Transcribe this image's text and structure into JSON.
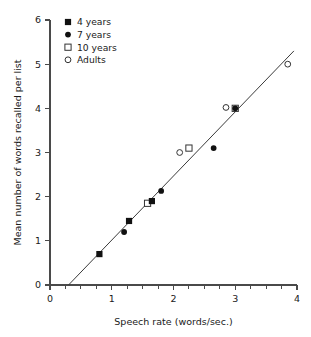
{
  "chart_data": {
    "type": "scatter",
    "title": "",
    "xlabel": "Speech rate (words/sec.)",
    "ylabel": "Mean number of words recalled per list",
    "xlim": [
      0,
      4
    ],
    "ylim": [
      0,
      6
    ],
    "xticks": [
      0,
      1,
      2,
      3,
      4
    ],
    "xtick_labels": [
      "0",
      "1",
      "2",
      "3",
      "4"
    ],
    "xminor_step": 0.25,
    "yticks": [
      0,
      1,
      2,
      3,
      4,
      5,
      6
    ],
    "ytick_labels": [
      "0",
      "1",
      "2",
      "3",
      "4",
      "5",
      "6"
    ],
    "grid": false,
    "legend_position": "top-left",
    "series": [
      {
        "name": "4 years",
        "marker": "filled-square",
        "color": "#111111",
        "points": [
          {
            "x": 0.8,
            "y": 0.7
          },
          {
            "x": 1.28,
            "y": 1.45
          },
          {
            "x": 1.65,
            "y": 1.9
          }
        ]
      },
      {
        "name": "7 years",
        "marker": "filled-circle",
        "color": "#111111",
        "points": [
          {
            "x": 1.2,
            "y": 1.2
          },
          {
            "x": 1.8,
            "y": 2.13
          },
          {
            "x": 2.65,
            "y": 3.1
          },
          {
            "x": 3.0,
            "y": 4.0
          }
        ]
      },
      {
        "name": "10 years",
        "marker": "open-square",
        "color": "#333333",
        "points": [
          {
            "x": 1.58,
            "y": 1.85
          },
          {
            "x": 2.25,
            "y": 3.1
          },
          {
            "x": 3.0,
            "y": 4.0
          }
        ]
      },
      {
        "name": "Adults",
        "marker": "open-circle",
        "color": "#333333",
        "points": [
          {
            "x": 2.1,
            "y": 3.0
          },
          {
            "x": 2.85,
            "y": 4.02
          },
          {
            "x": 3.85,
            "y": 5.0
          }
        ]
      }
    ],
    "trend_line": {
      "x_start": 0.3,
      "y_start": 0.0,
      "x_end": 3.95,
      "y_end": 5.3
    }
  },
  "legend": {
    "items": [
      {
        "label": "4 years",
        "marker": "filled-square"
      },
      {
        "label": "7 years",
        "marker": "filled-circle"
      },
      {
        "label": "10 years",
        "marker": "open-square"
      },
      {
        "label": "Adults",
        "marker": "open-circle"
      }
    ]
  }
}
